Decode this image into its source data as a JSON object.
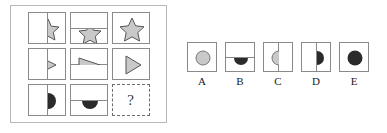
{
  "puzzle": {
    "type": "visual-analogy-matrix",
    "question_mark": "?",
    "colors": {
      "light_fill": "#c9c9c9",
      "dark_fill": "#2b2b2b",
      "stroke": "#555555",
      "cell_border": "#8a8a8a",
      "panel_border": "#b9b9b9",
      "background": "#ffffff"
    },
    "matrix": {
      "rows": 3,
      "cols": 3,
      "cells": [
        {
          "id": "cell-r1c1",
          "shape": "star",
          "fill": "light",
          "divider": "vertical",
          "portion": "right-of-line",
          "description": "Star straddling vertical line, right part shown"
        },
        {
          "id": "cell-r1c2",
          "shape": "star",
          "fill": "light",
          "divider": "horizontal",
          "portion": "below-line",
          "description": "Star straddling horizontal line, lower part shown"
        },
        {
          "id": "cell-r1c3",
          "shape": "star",
          "fill": "light",
          "divider": "none",
          "portion": "whole",
          "description": "Complete star, no dividing line"
        },
        {
          "id": "cell-r2c1",
          "shape": "triangle",
          "fill": "light",
          "divider": "vertical",
          "portion": "right-of-line",
          "description": "Triangle straddling vertical line, right part shown"
        },
        {
          "id": "cell-r2c2",
          "shape": "triangle",
          "fill": "light",
          "divider": "horizontal",
          "portion": "above-line",
          "description": "Triangle straddling horizontal line, upper part shown"
        },
        {
          "id": "cell-r2c3",
          "shape": "triangle",
          "fill": "light",
          "divider": "none",
          "portion": "whole",
          "description": "Complete triangle, no dividing line"
        },
        {
          "id": "cell-r3c1",
          "shape": "circle",
          "fill": "dark",
          "divider": "vertical",
          "portion": "right-of-line",
          "description": "Dark circle straddling vertical line, right part shown"
        },
        {
          "id": "cell-r3c2",
          "shape": "circle",
          "fill": "dark",
          "divider": "horizontal",
          "portion": "below-line",
          "description": "Dark circle straddling horizontal line, lower part shown"
        },
        {
          "id": "cell-r3c3",
          "shape": "question",
          "fill": "none",
          "divider": "none",
          "portion": "unknown",
          "description": "Missing tile marked with question mark, dashed border"
        }
      ]
    },
    "options": [
      {
        "id": "option-a",
        "label": "A",
        "shape": "circle",
        "fill": "light",
        "divider": "none",
        "portion": "whole",
        "description": "Light gray full circle, no dividing line"
      },
      {
        "id": "option-b",
        "label": "B",
        "shape": "circle",
        "fill": "dark",
        "divider": "horizontal",
        "portion": "below-line",
        "description": "Dark half circle below horizontal line"
      },
      {
        "id": "option-c",
        "label": "C",
        "shape": "circle",
        "fill": "light",
        "divider": "vertical",
        "portion": "left-of-line",
        "description": "Light gray half circle left of vertical line"
      },
      {
        "id": "option-d",
        "label": "D",
        "shape": "circle",
        "fill": "dark",
        "divider": "vertical",
        "portion": "right-of-line",
        "description": "Dark half circle right of vertical line"
      },
      {
        "id": "option-e",
        "label": "E",
        "shape": "circle",
        "fill": "dark",
        "divider": "none",
        "portion": "whole",
        "description": "Dark full circle, no dividing line"
      }
    ]
  }
}
